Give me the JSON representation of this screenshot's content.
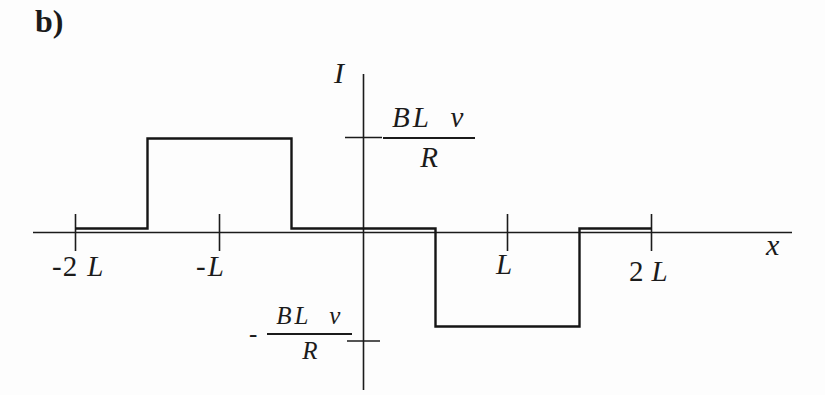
{
  "figure_label": "b)",
  "colors": {
    "background": "#fdfdfd",
    "ink": "#1b1b1b"
  },
  "axes": {
    "y_label": "I",
    "x_label": "x",
    "x_tick_labels": [
      {
        "pre": "-2",
        "sym": "L"
      },
      {
        "pre": "-",
        "sym": "L"
      },
      {
        "pre": "",
        "sym": "L"
      },
      {
        "pre": "2",
        "sym": "L"
      }
    ],
    "y_tick_labels": {
      "positive": {
        "sign": "",
        "num": "BL v",
        "den": "R"
      },
      "negative": {
        "sign": "-",
        "num": "BL v",
        "den": "R"
      }
    }
  },
  "chart_data": {
    "type": "line",
    "subtype": "step",
    "title": "",
    "xlabel": "x",
    "ylabel": "I",
    "x_unit": "L",
    "y_unit": "BLv/R",
    "xlim": [
      -2.3,
      3.0
    ],
    "ylim": [
      -1.7,
      1.7
    ],
    "grid": false,
    "legend": "none",
    "x_ticks": [
      {
        "x": -2,
        "label": "-2 L"
      },
      {
        "x": -1,
        "label": "-L"
      },
      {
        "x": 1,
        "label": "L"
      },
      {
        "x": 2,
        "label": "2 L"
      }
    ],
    "y_ticks": [
      {
        "y": 1,
        "label": "BL v / R"
      },
      {
        "y": -1,
        "label": "- BL v / R"
      }
    ],
    "series": [
      {
        "name": "I(x)",
        "points": [
          [
            -2,
            0
          ],
          [
            -1.5,
            0
          ],
          [
            -1.5,
            1
          ],
          [
            -0.5,
            1
          ],
          [
            -0.5,
            0
          ],
          [
            0.5,
            0
          ],
          [
            0.5,
            -1
          ],
          [
            1.5,
            -1
          ],
          [
            1.5,
            0
          ],
          [
            2,
            0
          ]
        ]
      }
    ],
    "segments": [
      {
        "x_from": -2,
        "x_to": -1.5,
        "I": "0"
      },
      {
        "x_from": -1.5,
        "x_to": -0.5,
        "I": "+BLv/R"
      },
      {
        "x_from": -0.5,
        "x_to": 0.5,
        "I": "0"
      },
      {
        "x_from": 0.5,
        "x_to": 1.5,
        "I": "-BLv/R"
      },
      {
        "x_from": 1.5,
        "x_to": 2,
        "I": "0"
      }
    ]
  }
}
